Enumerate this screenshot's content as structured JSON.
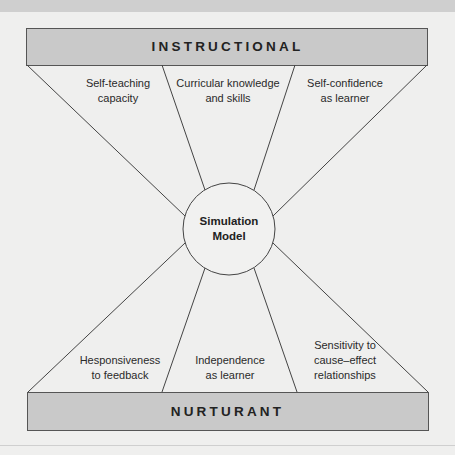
{
  "diagram": {
    "top_band": {
      "title": "INSTRUCTIONAL"
    },
    "bottom_band": {
      "title": "NURTURANT"
    },
    "center": {
      "line1": "Simulation",
      "line2": "Model"
    },
    "top_labels": [
      {
        "line1": "Self-teaching",
        "line2": "capacity"
      },
      {
        "line1": "Curricular knowledge",
        "line2": "and skills"
      },
      {
        "line1": "Self-confidence",
        "line2": "as learner"
      }
    ],
    "bottom_labels": [
      {
        "line1": "Hesponsiveness",
        "line2": "to feedback"
      },
      {
        "line1": "Independence",
        "line2": "as learner"
      },
      {
        "line1": "Sensitivity to",
        "line2": "cause–effect",
        "line3": "relationships"
      }
    ],
    "colors": {
      "background": "#efefee",
      "band_fill": "#c9c9c9",
      "stroke": "#444444",
      "text": "#222222"
    }
  }
}
